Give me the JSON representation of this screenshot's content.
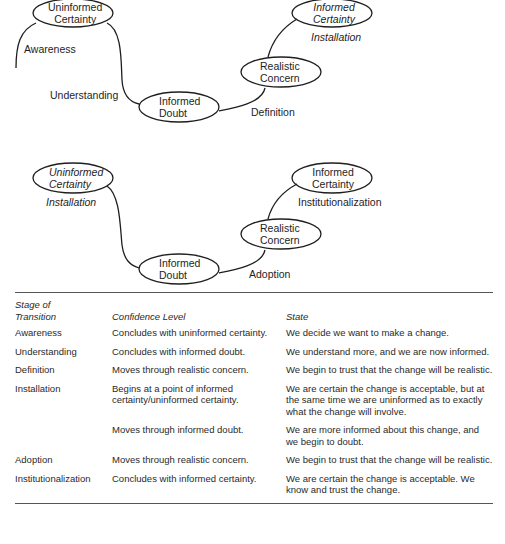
{
  "diagram_top": {
    "nodes": [
      {
        "id": "uninformed-certainty",
        "line1": "Uninformed",
        "line2": "Certainty",
        "italic": false
      },
      {
        "id": "informed-doubt",
        "line1": "Informed",
        "line2": "Doubt",
        "italic": false
      },
      {
        "id": "realistic-concern",
        "line1": "Realistic",
        "line2": "Concern",
        "italic": false
      },
      {
        "id": "informed-certainty",
        "line1": "Informed",
        "line2": "Certainty",
        "italic": true
      }
    ],
    "stages": {
      "awareness": "Awareness",
      "understanding": "Understanding",
      "definition": "Definition",
      "installation": "Installation"
    }
  },
  "diagram_bottom": {
    "nodes": [
      {
        "id": "uninformed-certainty",
        "line1": "Uninformed",
        "line2": "Certainty",
        "italic": true
      },
      {
        "id": "informed-doubt",
        "line1": "Informed",
        "line2": "Doubt",
        "italic": false
      },
      {
        "id": "realistic-concern",
        "line1": "Realistic",
        "line2": "Concern",
        "italic": false
      },
      {
        "id": "informed-certainty",
        "line1": "Informed",
        "line2": "Certainty",
        "italic": false
      }
    ],
    "stages": {
      "installation": "Installation",
      "adoption": "Adoption",
      "institutionalization": "Institutionalization"
    }
  },
  "table": {
    "headers": {
      "stage_line1": "Stage of",
      "stage_line2": "Transition",
      "confidence": "Confidence Level",
      "state": "State"
    },
    "rows": [
      {
        "stage": "Awareness",
        "confidence": "Concludes with uninformed certainty.",
        "state": "We decide we want to make a change."
      },
      {
        "stage": "Understanding",
        "confidence": "Concludes with informed doubt.",
        "state": "We understand more, and we are now informed."
      },
      {
        "stage": "Definition",
        "confidence": "Moves through realistic concern.",
        "state": "We begin to trust that the change will be realistic."
      },
      {
        "stage": "Installation",
        "confidence": "Begins at a point of informed certainty/uninformed certainty.",
        "state": "We are certain the change is acceptable, but at the same time we are uninformed as to exactly what the change will involve."
      },
      {
        "stage": "",
        "confidence": "Moves through informed doubt.",
        "state": "We are more informed about this change, and we begin to doubt."
      },
      {
        "stage": "Adoption",
        "confidence": "Moves through realistic concern.",
        "state": "We begin to trust that the change will be realistic."
      },
      {
        "stage": "Institutionalization",
        "confidence": "Concludes with informed certainty.",
        "state": "We are certain the change is acceptable. We know and trust the change."
      }
    ]
  }
}
